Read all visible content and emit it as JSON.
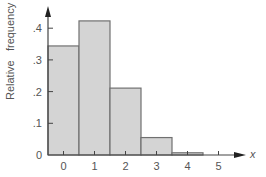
{
  "chart_data": {
    "type": "bar",
    "title": "",
    "xlabel": "x",
    "ylabel": "Relative   frequency",
    "categories": [
      "0",
      "1",
      "2",
      "3",
      "4",
      "5"
    ],
    "values": [
      0.344,
      0.423,
      0.211,
      0.055,
      0.007,
      0.0
    ],
    "y_ticks": [
      "0",
      ".1",
      ".2",
      ".3",
      ".4"
    ],
    "x_ticks": [
      "0",
      "1",
      "2",
      "3",
      "4",
      "5"
    ],
    "ylim": [
      0,
      0.45
    ],
    "grid": false,
    "legend": null,
    "bar_fill": "#d4d4d4",
    "bar_stroke": "#707070"
  }
}
